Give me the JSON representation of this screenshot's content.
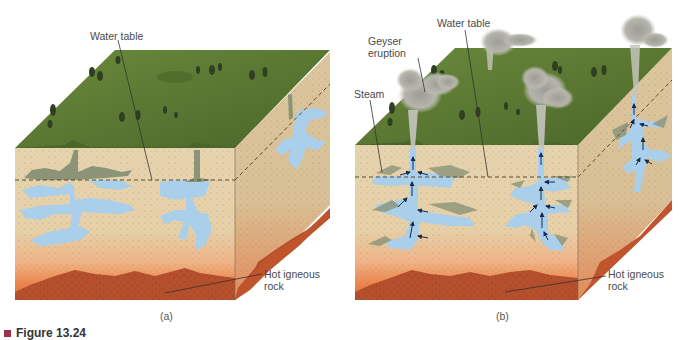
{
  "figure": {
    "title": "Figure 13.24",
    "marker_color": "#a0304a"
  },
  "panels": [
    {
      "id": "a",
      "caption": "(a)",
      "labels": {
        "water_table": "Water table",
        "hot_rock": "Hot igneous\nrock"
      }
    },
    {
      "id": "b",
      "caption": "(b)",
      "labels": {
        "geyser_eruption": "Geyser\neruption",
        "water_table": "Water table",
        "steam": "Steam",
        "hot_rock": "Hot igneous\nrock"
      }
    }
  ],
  "colors": {
    "grass": "#5d7a34",
    "grass_dark": "#46602a",
    "sediment": "#e2cfa8",
    "sediment_side": "#d9c39a",
    "water": "#a9cfea",
    "hot_zone": "#ee8a50",
    "igneous_rock": "#b5502c",
    "steam": "#a8a89e",
    "arrow": "#1a2a4a",
    "leader_line": "#333333"
  }
}
